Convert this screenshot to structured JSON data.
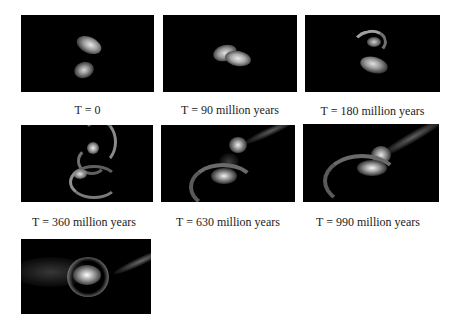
{
  "figure": {
    "panels": [
      {
        "id": "t0",
        "caption": "T = 0",
        "time_myr": 0
      },
      {
        "id": "t90",
        "caption": "T = 90 million years",
        "time_myr": 90
      },
      {
        "id": "t180",
        "caption": "T = 180 million years",
        "time_myr": 180
      },
      {
        "id": "t360",
        "caption": "T = 360 million years",
        "time_myr": 360
      },
      {
        "id": "t630",
        "caption": "T = 630 million years",
        "time_myr": 630
      },
      {
        "id": "t990",
        "caption": "T = 990 million years",
        "time_myr": 990
      },
      {
        "id": "tfinal",
        "caption": "",
        "time_myr": null
      }
    ],
    "colors": {
      "panel_background": "#000000",
      "page_background": "#ffffff",
      "caption_text": "#222222"
    }
  }
}
